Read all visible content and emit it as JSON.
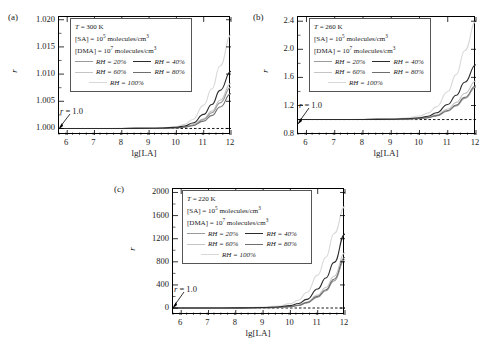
{
  "figure": {
    "xlabel": "lg[LA]",
    "ylabel": "r",
    "annotation": "r = 1.0",
    "annotation_value": 1.0
  },
  "legend_common": {
    "sa_line": "[SA] = 10^5 molecules/cm^3",
    "sa_prefix": "[SA] = 10",
    "sa_exp": "5",
    "sa_suffix": " molecules/cm",
    "sa_unit_exp": "3",
    "dma_prefix": "[DMA] = 10",
    "dma_exp": "7",
    "dma_suffix": " molecules/cm",
    "dma_unit_exp": "3",
    "series_labels": [
      "RH = 20%",
      "RH = 40%",
      "RH = 60%",
      "RH = 80%",
      "RH = 100%"
    ],
    "series_colors": [
      "#9a9a9a",
      "#2b2b2b",
      "#c4c4c4",
      "#6e6e6e",
      "#d8d8d8"
    ]
  },
  "panels": [
    {
      "key": "a",
      "label": "(a)",
      "temp_prefix": "T",
      "temp_text": " = 300 K",
      "temperature_k": 300
    },
    {
      "key": "b",
      "label": "(b)",
      "temp_prefix": "T",
      "temp_text": " = 260 K",
      "temperature_k": 260
    },
    {
      "key": "c",
      "label": "(c)",
      "temp_prefix": "T",
      "temp_text": " = 220 K",
      "temperature_k": 220
    }
  ],
  "chart_data": [
    {
      "type": "line",
      "panel": "a",
      "title": "(a) T = 300 K",
      "xlabel": "lg[LA]",
      "ylabel": "r",
      "xlim": [
        5.7,
        12
      ],
      "ylim": [
        0.9988,
        1.0205
      ],
      "xticks": [
        6,
        7,
        8,
        9,
        10,
        11,
        12
      ],
      "yticks": [
        1.0,
        1.005,
        1.01,
        1.015,
        1.02
      ],
      "ytick_labels": [
        "1.000",
        "1.005",
        "1.010",
        "1.015",
        "1.020"
      ],
      "reference_line": 1.0,
      "grid": false,
      "legend_position": "upper-left-inset",
      "x": [
        5.7,
        6,
        7,
        8,
        9,
        9.5,
        10,
        10.3,
        10.6,
        11,
        11.3,
        11.6,
        12
      ],
      "series": [
        {
          "name": "RH = 20%",
          "color": "#9a9a9a",
          "values": [
            1.0,
            1.0,
            1.0,
            1.0,
            1.00002,
            1.00005,
            1.00013,
            1.00027,
            1.0006,
            1.00165,
            1.0029,
            1.0047,
            1.0076
          ]
        },
        {
          "name": "RH = 40%",
          "color": "#2b2b2b",
          "values": [
            1.0,
            1.0,
            1.0,
            1.0,
            1.00003,
            1.00008,
            1.00022,
            1.00046,
            1.001,
            1.0026,
            1.0044,
            1.007,
            1.0105
          ]
        },
        {
          "name": "RH = 60%",
          "color": "#c4c4c4",
          "values": [
            1.0,
            1.0,
            1.0,
            1.0,
            1.00002,
            1.00006,
            1.00015,
            1.00031,
            1.00068,
            1.0018,
            1.0032,
            1.0052,
            1.0083
          ]
        },
        {
          "name": "RH = 80%",
          "color": "#6e6e6e",
          "values": [
            1.0,
            1.0,
            1.0,
            1.0,
            1.00002,
            1.00004,
            1.00011,
            1.00023,
            1.0005,
            1.00135,
            1.0024,
            1.00395,
            1.0064
          ]
        },
        {
          "name": "RH = 100%",
          "color": "#d8d8d8",
          "values": [
            1.0,
            1.0,
            1.0,
            1.00001,
            1.00005,
            1.00013,
            1.00035,
            1.00075,
            1.00165,
            1.0043,
            1.0073,
            1.0115,
            1.0172
          ]
        }
      ]
    },
    {
      "type": "line",
      "panel": "b",
      "title": "(b) T = 260 K",
      "xlabel": "lg[LA]",
      "ylabel": "r",
      "xlim": [
        5.7,
        12
      ],
      "ylim": [
        0.78,
        2.46
      ],
      "xticks": [
        6,
        7,
        8,
        9,
        10,
        11,
        12
      ],
      "yticks": [
        0.8,
        1.2,
        1.6,
        2.0,
        2.4
      ],
      "ytick_labels": [
        "0.8",
        "1.2",
        "1.6",
        "2.0",
        "2.4"
      ],
      "reference_line": 1.0,
      "grid": false,
      "legend_position": "upper-left-inset",
      "x": [
        5.7,
        6,
        7,
        8,
        9,
        9.5,
        10,
        10.3,
        10.6,
        11,
        11.3,
        11.6,
        12
      ],
      "series": [
        {
          "name": "RH = 20%",
          "color": "#9a9a9a",
          "values": [
            1.0,
            1.0,
            1.0,
            1.001,
            1.003,
            1.006,
            1.014,
            1.026,
            1.052,
            1.12,
            1.195,
            1.3,
            1.46
          ]
        },
        {
          "name": "RH = 40%",
          "color": "#2b2b2b",
          "values": [
            1.0,
            1.0,
            1.0,
            1.001,
            1.005,
            1.011,
            1.026,
            1.048,
            1.096,
            1.215,
            1.345,
            1.53,
            1.78
          ]
        },
        {
          "name": "RH = 60%",
          "color": "#c4c4c4",
          "values": [
            1.0,
            1.0,
            1.0,
            1.001,
            1.004,
            1.008,
            1.018,
            1.033,
            1.066,
            1.15,
            1.245,
            1.37,
            1.55
          ]
        },
        {
          "name": "RH = 80%",
          "color": "#6e6e6e",
          "values": [
            1.0,
            1.0,
            1.0,
            1.001,
            1.003,
            1.006,
            1.015,
            1.028,
            1.056,
            1.128,
            1.208,
            1.315,
            1.48
          ]
        },
        {
          "name": "RH = 100%",
          "color": "#d8d8d8",
          "values": [
            1.0,
            1.0,
            1.001,
            1.002,
            1.01,
            1.022,
            1.05,
            1.092,
            1.18,
            1.4,
            1.64,
            1.98,
            2.4
          ]
        }
      ]
    },
    {
      "type": "line",
      "panel": "c",
      "title": "(c) T = 220 K",
      "xlabel": "lg[LA]",
      "ylabel": "r",
      "xlim": [
        5.7,
        12
      ],
      "ylim": [
        -120,
        2060
      ],
      "xticks": [
        6,
        7,
        8,
        9,
        10,
        11,
        12
      ],
      "yticks": [
        0,
        400,
        800,
        1200,
        1600,
        2000
      ],
      "ytick_labels": [
        "0",
        "400",
        "800",
        "1200",
        "1600",
        "2000"
      ],
      "reference_line": 1.0,
      "grid": false,
      "legend_position": "upper-left-inset",
      "x": [
        5.7,
        6,
        7,
        8,
        9,
        9.5,
        10,
        10.3,
        10.6,
        11,
        11.3,
        11.6,
        12
      ],
      "series": [
        {
          "name": "RH = 20%",
          "color": "#9a9a9a",
          "values": [
            1,
            1,
            1,
            2,
            5,
            10,
            24,
            45,
            88,
            190,
            300,
            470,
            840
          ]
        },
        {
          "name": "RH = 40%",
          "color": "#2b2b2b",
          "values": [
            1,
            1,
            1,
            3,
            9,
            18,
            42,
            78,
            150,
            330,
            520,
            790,
            1280
          ]
        },
        {
          "name": "RH = 60%",
          "color": "#c4c4c4",
          "values": [
            1,
            1,
            1,
            2,
            6,
            12,
            29,
            54,
            104,
            225,
            355,
            550,
            960
          ]
        },
        {
          "name": "RH = 80%",
          "color": "#6e6e6e",
          "values": [
            1,
            1,
            1,
            2,
            5,
            11,
            26,
            48,
            94,
            202,
            318,
            498,
            880
          ]
        },
        {
          "name": "RH = 100%",
          "color": "#d8d8d8",
          "values": [
            1,
            1,
            2,
            5,
            16,
            33,
            76,
            140,
            268,
            570,
            880,
            1290,
            1760
          ]
        }
      ]
    }
  ]
}
